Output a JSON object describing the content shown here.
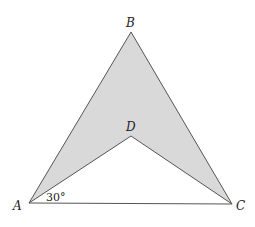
{
  "figure": {
    "type": "geometry",
    "points": {
      "A": {
        "label": "A",
        "x": 29,
        "y": 203
      },
      "B": {
        "label": "B",
        "x": 131,
        "y": 32
      },
      "C": {
        "label": "C",
        "x": 232,
        "y": 204
      },
      "D": {
        "label": "D",
        "x": 131,
        "y": 136
      }
    },
    "angle_label": "30°",
    "colors": {
      "shade": "#d9d9d9",
      "stroke": "#555555"
    }
  }
}
